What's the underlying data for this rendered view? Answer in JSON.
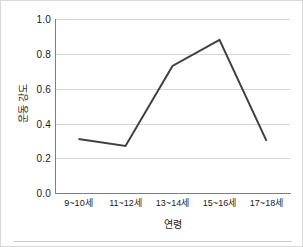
{
  "chart_data": {
    "type": "line",
    "title": "",
    "subtitle": "",
    "xlabel": "연령",
    "ylabel": "운동 강도",
    "categories": [
      "9~10세",
      "11~12세",
      "13~14세",
      "15~16세",
      "17~18세"
    ],
    "values": [
      0.31,
      0.27,
      0.73,
      0.88,
      0.3
    ],
    "series": [
      {
        "name": "운동 강도",
        "values": [
          0.31,
          0.27,
          0.73,
          0.88,
          0.3
        ]
      }
    ],
    "ylim": [
      0.0,
      1.0
    ],
    "ytick_labels": [
      "0.0",
      "0.2",
      "0.4",
      "0.6",
      "0.8",
      "1.0"
    ],
    "ytick_values": [
      0.0,
      0.2,
      0.4,
      0.6,
      0.8,
      1.0
    ],
    "grid": "horizontal",
    "legend": "none",
    "markers": "none",
    "line_color": "#404040",
    "grid_color": "#d6d6d6",
    "axis_color": "#7f7f7f",
    "text_color": "#1a1a1a"
  }
}
